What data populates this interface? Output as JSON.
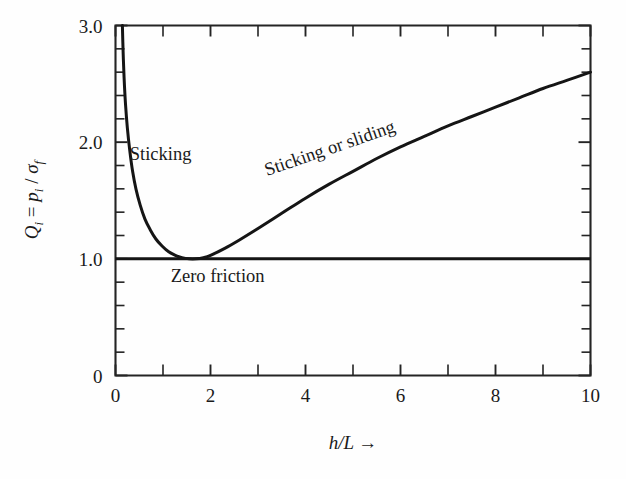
{
  "figure": {
    "background_color": "#fefefe",
    "ink_color": "#1a1a1a"
  },
  "chart_data": {
    "type": "line",
    "title": "",
    "xlabel": "h/L →",
    "ylabel": "Q_i = p_i / σ_f",
    "xlim": [
      0,
      10
    ],
    "ylim": [
      0,
      3.0
    ],
    "grid": false,
    "legend": "none",
    "x_ticks_major": [
      "0",
      "2",
      "4",
      "6",
      "8",
      "10"
    ],
    "x_ticks_major_values": [
      0,
      2,
      4,
      6,
      8,
      10
    ],
    "x_ticks_minor_values": [
      1,
      3,
      5,
      7,
      9
    ],
    "y_ticks_major": [
      "0",
      "1.0",
      "2.0",
      "3.0"
    ],
    "y_ticks_major_values": [
      0,
      1.0,
      2.0,
      3.0
    ],
    "y_ticks_minor_values": [
      0.2,
      0.4,
      0.6,
      0.8,
      1.2,
      1.4,
      1.6,
      1.8,
      2.2,
      2.4,
      2.6,
      2.8
    ],
    "series": [
      {
        "name": "Sticking or sliding",
        "comment": "U-shaped curve: steep drop from Q=3.0 near h/L=0.15, minimum Q=1.0 at h/L~1.5, then rising to Q=2.6 at h/L=10",
        "x": [
          0.145,
          0.16,
          0.18,
          0.21,
          0.25,
          0.3,
          0.36,
          0.43,
          0.52,
          0.62,
          0.73,
          0.85,
          0.98,
          1.12,
          1.26,
          1.4,
          1.55,
          1.7,
          1.85,
          2.0,
          2.3,
          2.6,
          3.0,
          3.5,
          4.0,
          4.5,
          5.0,
          5.5,
          6.0,
          6.5,
          7.0,
          7.5,
          8.0,
          8.5,
          9.0,
          9.5,
          10.0
        ],
        "y": [
          3.0,
          2.78,
          2.56,
          2.33,
          2.12,
          1.93,
          1.75,
          1.6,
          1.46,
          1.34,
          1.25,
          1.17,
          1.11,
          1.06,
          1.03,
          1.01,
          1.0,
          1.0,
          1.01,
          1.03,
          1.09,
          1.16,
          1.26,
          1.39,
          1.52,
          1.64,
          1.75,
          1.86,
          1.96,
          2.05,
          2.14,
          2.22,
          2.3,
          2.38,
          2.46,
          2.53,
          2.6
        ]
      },
      {
        "name": "Zero friction",
        "comment": "Horizontal reference line at Q = 1.0 spanning the full x range",
        "x": [
          0,
          10
        ],
        "y": [
          1.0,
          1.0
        ]
      }
    ],
    "annotations": [
      {
        "text": "Sticking",
        "x": 0.95,
        "y": 1.85,
        "rotation": 0
      },
      {
        "text": "Sticking or sliding",
        "x": 4.55,
        "y": 1.9,
        "rotation": -19
      },
      {
        "text": "Zero friction",
        "x": 2.15,
        "y": 0.8,
        "rotation": 0
      }
    ]
  },
  "axis_title_y": {
    "q": "Q",
    "q_sub": "i",
    "eq": " = ",
    "p": "p",
    "p_sub": "i",
    "slash": " / ",
    "sigma": "σ",
    "sigma_sub": "f"
  },
  "axis_title_x": {
    "hl": "h/L",
    "arrow": "→"
  }
}
